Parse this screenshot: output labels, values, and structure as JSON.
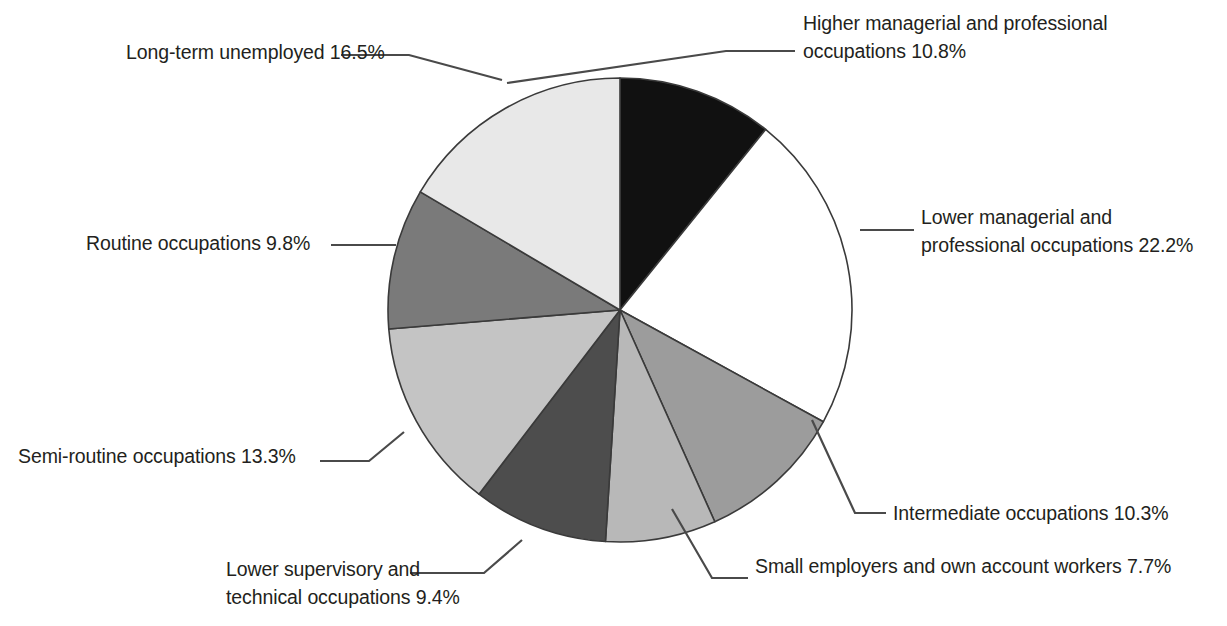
{
  "chart_data": {
    "type": "pie",
    "title": "",
    "subtitle": "",
    "xlabel": "",
    "ylabel": "",
    "legend_position": "callout-labels",
    "grid": false,
    "units": "percent",
    "total": 100.0,
    "start_angle_deg": 0,
    "direction": "clockwise",
    "categories": [
      "Higher managerial and professional occupations",
      "Lower managerial and professional occupations",
      "Intermediate occupations",
      "Small employers and own account workers",
      "Lower supervisory and technical occupations",
      "Semi-routine occupations",
      "Routine occupations",
      "Long-term unemployed"
    ],
    "values": [
      10.8,
      22.2,
      10.3,
      7.7,
      9.4,
      13.3,
      9.8,
      16.5
    ],
    "colors": [
      "#111111",
      "#ffffff",
      "#9c9c9c",
      "#b8b8b8",
      "#4d4d4d",
      "#c4c4c4",
      "#7a7a7a",
      "#e8e8e8"
    ],
    "slice_stroke": "#3a3a3a",
    "slices": [
      {
        "label": "Higher managerial and professional occupations",
        "value": 10.8,
        "color": "#111111"
      },
      {
        "label": "Lower managerial and professional occupations",
        "value": 22.2,
        "color": "#ffffff"
      },
      {
        "label": "Intermediate occupations",
        "value": 10.3,
        "color": "#9c9c9c"
      },
      {
        "label": "Small employers and own account workers",
        "value": 7.7,
        "color": "#b8b8b8"
      },
      {
        "label": "Lower supervisory and technical occupations",
        "value": 9.4,
        "color": "#4d4d4d"
      },
      {
        "label": "Semi-routine occupations",
        "value": 13.3,
        "color": "#c4c4c4"
      },
      {
        "label": "Routine occupations",
        "value": 9.8,
        "color": "#7a7a7a"
      },
      {
        "label": "Long-term unemployed",
        "value": 16.5,
        "color": "#e8e8e8"
      }
    ]
  },
  "labels": {
    "higher_managerial": "Higher managerial and professional\noccupations 10.8%",
    "lower_managerial": "Lower managerial and\nprofessional occupations 22.2%",
    "intermediate": "Intermediate occupations 10.3%",
    "small_employers": "Small employers and own account workers 7.7%",
    "lower_supervisory": "Lower supervisory and\ntechnical occupations 9.4%",
    "semi_routine": "Semi-routine occupations 13.3%",
    "routine": "Routine occupations 9.8%",
    "long_term_unemployed": "Long-term unemployed 16.5%"
  },
  "geometry": {
    "center_x": 620,
    "center_y": 310,
    "radius": 232
  }
}
